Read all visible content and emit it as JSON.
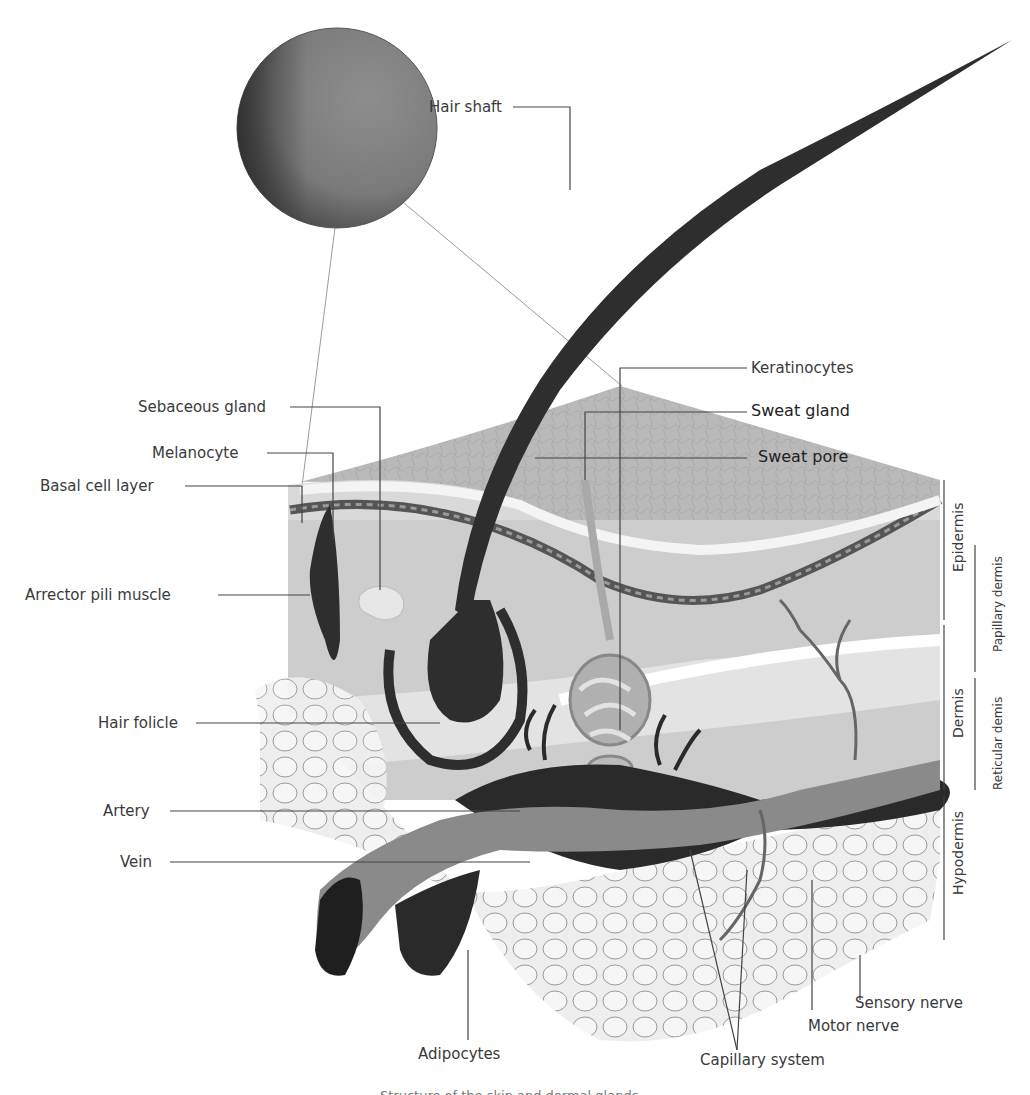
{
  "diagram": {
    "type": "anatomical-cross-section",
    "labels": {
      "hair_shaft": "Hair shaft",
      "sebaceous_gland": "Sebaceous gland",
      "melanocyte": "Melanocyte",
      "basal_cell_layer": "Basal cell layer",
      "arrector_pili_muscle": "Arrector pili muscle",
      "hair_follicle": "Hair folicle",
      "artery": "Artery",
      "vein": "Vein",
      "adipocytes": "Adipocytes",
      "keratinocytes": "Keratinocytes",
      "sweat_gland": "Sweat gland",
      "sweat_pore": "Sweat pore",
      "sensory_nerve": "Sensory nerve",
      "motor_nerve": "Motor nerve",
      "capillary_system": "Capillary system"
    },
    "layers": {
      "epidermis": "Epidermis",
      "dermis": "Dermis",
      "hypodermis": "Hypodermis",
      "papillary_dermis": "Papillary dermis",
      "reticular_dermis": "Reticular demis"
    },
    "caption": "Structure of the skin and dermal glands",
    "colors": {
      "label_text": "#3a3a3a",
      "leader_line": "#444444",
      "hair": "#2e2e2e",
      "skin_surface": "#b8b8b8",
      "dermis": "#cfcfcf",
      "vessel_dark": "#2a2a2a",
      "fat": "#e6e6e6"
    }
  }
}
